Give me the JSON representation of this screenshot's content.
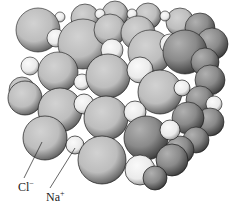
{
  "labels": {
    "chloride": {
      "text": "Cl",
      "charge": "−"
    },
    "sodium": {
      "text": "Na",
      "charge": "+"
    }
  },
  "colors": {
    "chloride_fill": "#c4c4c4",
    "sodium_fill": "#efefef",
    "outline": "#1a1a1a",
    "shadow": "#3a3a3a",
    "background": "#ffffff"
  }
}
